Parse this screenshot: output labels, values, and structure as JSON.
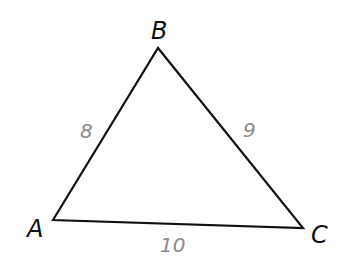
{
  "diagram": {
    "type": "triangle",
    "vertices": [
      {
        "name": "A",
        "x": 53,
        "y": 220,
        "label_x": 27,
        "label_y": 237
      },
      {
        "name": "B",
        "x": 158,
        "y": 48,
        "label_x": 151,
        "label_y": 39
      },
      {
        "name": "C",
        "x": 303,
        "y": 228,
        "label_x": 311,
        "label_y": 243
      }
    ],
    "sides": [
      {
        "between": "AB",
        "length": "8",
        "label_x": 80,
        "label_y": 138
      },
      {
        "between": "BC",
        "length": "9",
        "label_x": 243,
        "label_y": 137
      },
      {
        "between": "AC",
        "length": "10",
        "label_x": 160,
        "label_y": 252
      }
    ],
    "colors": {
      "stroke": "#111111",
      "vertex_label": "#111111",
      "side_label": "#8a8a8a",
      "background": "#ffffff"
    }
  }
}
